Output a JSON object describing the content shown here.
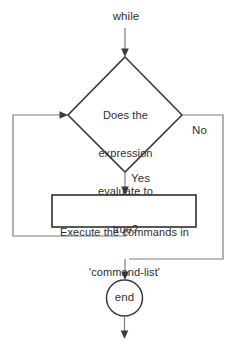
{
  "diagram": {
    "type": "flowchart",
    "background_color": "#ffffff",
    "shape_stroke_color": "#3b3b3b",
    "connector_color": "#7d7d7d",
    "text_color": "#2f2f2f",
    "entry_label": "while",
    "decision": {
      "shape": "diamond",
      "line1": "Does the",
      "line2": "expression",
      "line3": "evaluate to",
      "line4": "true?"
    },
    "branch_true_label": "Yes",
    "branch_false_label": "No",
    "process": {
      "shape": "rectangle",
      "line1": "Execute the commands in",
      "line2": "'command-list'"
    },
    "terminator": {
      "shape": "circle",
      "label": "end"
    }
  }
}
